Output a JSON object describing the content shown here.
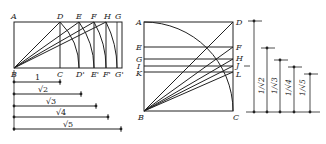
{
  "figure": {
    "left": {
      "title": "Construction of root rectangles (rebatement method)",
      "top_labels": [
        "A",
        "D",
        "E",
        "F",
        "H",
        "G"
      ],
      "bottom_labels": [
        "B",
        "C",
        "D'",
        "E'",
        "F'",
        "G'"
      ],
      "unit_label": "1",
      "bar_labels": [
        "√2",
        "√3",
        "√4",
        "√5"
      ]
    },
    "right": {
      "title": "Construction of reciprocal root rectangles in a square",
      "left_labels": [
        "A",
        "E",
        "G",
        "I",
        "K",
        "B"
      ],
      "right_labels": [
        "D",
        "F",
        "H",
        "J",
        "L",
        "C"
      ],
      "bar_labels": [
        "1/√2",
        "1/√3",
        "1/√4",
        "1/√5"
      ]
    },
    "colors": {
      "stroke": "#222222",
      "background": "#ffffff"
    }
  }
}
